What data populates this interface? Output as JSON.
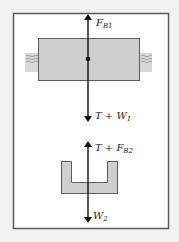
{
  "figure": {
    "background": "#f2f2f2",
    "frame_color": "#5a5a5a",
    "body_fill": "#cfcfcf",
    "body_stroke": "#5a5a5a",
    "arrow_color": "#111111"
  },
  "body1": {
    "forces": [
      {
        "name": "F",
        "subscript": "B1",
        "direction": "up"
      },
      {
        "name": "T + W",
        "subscript": "1",
        "direction": "down"
      }
    ]
  },
  "body2": {
    "forces": [
      {
        "name": "T + F",
        "subscript": "B2",
        "direction": "up"
      },
      {
        "name": "W",
        "subscript": "2",
        "direction": "down"
      }
    ]
  }
}
